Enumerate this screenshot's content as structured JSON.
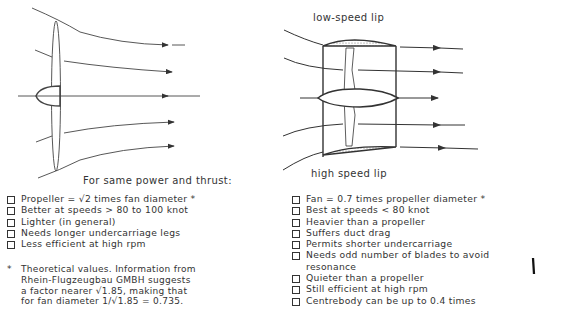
{
  "diagram": {
    "left_title": "Propeller",
    "right_labels": {
      "top_lip": "low-speed lip",
      "bottom_lip": "high speed lip"
    }
  },
  "comparison_heading": "For same power and thrust:",
  "propeller_points": [
    "Propeller = √2 times fan diameter *",
    "Better at speeds > 80 to 100 knot",
    "Lighter (in general)",
    "Needs longer undercarriage legs",
    "Less efficient at high rpm"
  ],
  "fan_points": [
    "Fan = 0.7 times propeller diameter *",
    "Best at speeds < 80 knot",
    "Heavier than a propeller",
    "Suffers duct drag",
    "Permits shorter undercarriage",
    "Needs odd number of blades to avoid resonance",
    "Quieter than a propeller",
    "Still efficient at high rpm",
    "Centrebody can be up to 0.4 times"
  ],
  "footnote": {
    "marker": "*",
    "text": "Theoretical values. Information from\nRhein-Flugzeugbau GMBH suggests\na factor nearer √1.85, making that\nfor fan diameter 1/√1.85 = 0.735."
  }
}
